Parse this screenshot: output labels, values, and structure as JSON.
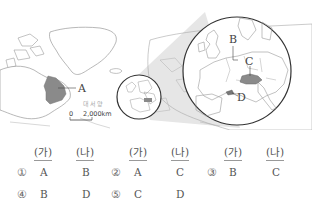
{
  "map": {
    "labels": {
      "A": "A",
      "B": "B",
      "C": "C",
      "D": "D"
    },
    "ocean_label": "대서양",
    "scale": {
      "zero": "0",
      "distance": "2,000km"
    },
    "colors": {
      "highlight": "#8a8a8a",
      "outline": "#333333",
      "land_line": "#9a9a9a",
      "zoom_cone": "#e4e4e4"
    }
  },
  "choices": {
    "headers": [
      "(가)",
      "(나)",
      "(가)",
      "(나)",
      "(가)",
      "(나)"
    ],
    "options": [
      {
        "number": "①",
        "ga": "A",
        "na": "B"
      },
      {
        "number": "②",
        "ga": "A",
        "na": "C"
      },
      {
        "number": "③",
        "ga": "B",
        "na": "C"
      },
      {
        "number": "④",
        "ga": "B",
        "na": "D"
      },
      {
        "number": "⑤",
        "ga": "C",
        "na": "D"
      }
    ]
  }
}
